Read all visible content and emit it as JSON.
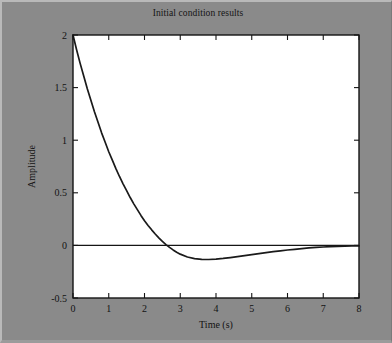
{
  "figure": {
    "background_color": "#8a8a8a",
    "plot_background_color": "#ffffff",
    "line_color": "#1a1a1a",
    "axis_color": "#151515"
  },
  "chart_data": {
    "type": "line",
    "title": "Initial condition results",
    "xlabel": "Time (s)",
    "ylabel": "Amplitude",
    "xlim": [
      0,
      8
    ],
    "ylim": [
      -0.5,
      2
    ],
    "xticks": [
      "0",
      "1",
      "2",
      "3",
      "4",
      "5",
      "6",
      "7",
      "8"
    ],
    "yticks": [
      "-0.5",
      "0",
      "0.5",
      "1",
      "1.5",
      "2"
    ],
    "xtick_values": [
      0,
      1,
      2,
      3,
      4,
      5,
      6,
      7,
      8
    ],
    "ytick_values": [
      -0.5,
      0,
      0.5,
      1,
      1.5,
      2
    ],
    "grid": false,
    "legend": null,
    "series": [
      {
        "name": "Initial condition response",
        "x": [
          0,
          0.1,
          0.2,
          0.3,
          0.4,
          0.5,
          0.6,
          0.7,
          0.8,
          0.9,
          1.0,
          1.1,
          1.2,
          1.3,
          1.4,
          1.5,
          1.6,
          1.7,
          1.8,
          1.9,
          2.0,
          2.1,
          2.2,
          2.3,
          2.4,
          2.5,
          2.6,
          2.7,
          2.8,
          2.9,
          3.0,
          3.2,
          3.4,
          3.6,
          3.8,
          4.0,
          4.2,
          4.4,
          4.6,
          4.8,
          5.0,
          5.2,
          5.4,
          5.6,
          5.8,
          6.0,
          6.2,
          6.4,
          6.6,
          6.8,
          7.0,
          7.2,
          7.4,
          7.6,
          7.8,
          8.0
        ],
        "y": [
          2.0,
          1.86,
          1.73,
          1.61,
          1.49,
          1.38,
          1.27,
          1.17,
          1.07,
          0.98,
          0.89,
          0.81,
          0.73,
          0.655,
          0.585,
          0.52,
          0.455,
          0.395,
          0.34,
          0.285,
          0.235,
          0.19,
          0.148,
          0.108,
          0.072,
          0.038,
          0.008,
          -0.019,
          -0.043,
          -0.065,
          -0.083,
          -0.11,
          -0.126,
          -0.133,
          -0.134,
          -0.13,
          -0.124,
          -0.116,
          -0.107,
          -0.097,
          -0.088,
          -0.078,
          -0.069,
          -0.06,
          -0.052,
          -0.044,
          -0.037,
          -0.03,
          -0.024,
          -0.019,
          -0.015,
          -0.012,
          -0.009,
          -0.007,
          -0.005,
          -0.004
        ]
      }
    ],
    "annotations": [
      {
        "label": "zero-reference-line",
        "value": 0
      }
    ]
  }
}
